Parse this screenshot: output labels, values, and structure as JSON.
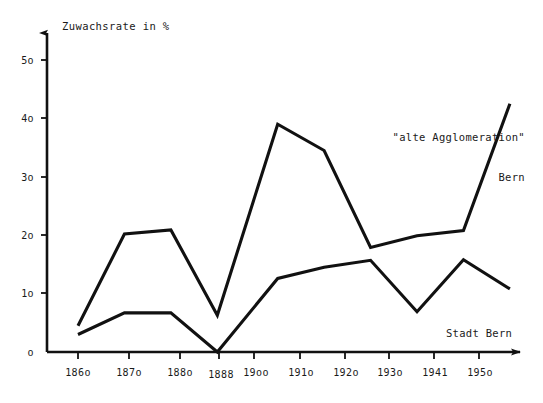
{
  "chart_data": {
    "type": "line",
    "title": "",
    "ylabel": "Zuwachsrate in %",
    "xlabel": "",
    "grid": false,
    "legend_position": "inline-annotations",
    "ylim": [
      0,
      52
    ],
    "y_ticks": [
      {
        "value": 0,
        "label": "o"
      },
      {
        "value": 10,
        "label": "1o"
      },
      {
        "value": 20,
        "label": "2o"
      },
      {
        "value": 30,
        "label": "3o"
      },
      {
        "value": 40,
        "label": "4o"
      },
      {
        "value": 50,
        "label": "5o"
      }
    ],
    "categories": [
      "186o",
      "187o",
      "188o",
      "1888",
      "19oo",
      "191o",
      "192o",
      "193o",
      "1941",
      "195o"
    ],
    "x_positions": [
      0,
      1,
      2,
      3,
      4.3,
      5.3,
      6.3,
      7.3,
      8.3,
      9.3
    ],
    "series": [
      {
        "name": "\"alte Agglomeration\" Bern",
        "values": [
          4.5,
          20.2,
          20.9,
          6.3,
          39.0,
          34.5,
          17.9,
          19.9,
          20.8,
          42.5
        ]
      },
      {
        "name": "Stadt Bern",
        "values": [
          3.0,
          6.7,
          6.7,
          0.0,
          12.6,
          14.5,
          15.7,
          6.9,
          15.8,
          10.8
        ]
      }
    ],
    "annotations": [
      {
        "id": "agglo",
        "line1": "\"alte Agglomeration\"",
        "line2": "Bern"
      },
      {
        "id": "stadt",
        "line1": "Stadt Bern"
      }
    ],
    "colors": {
      "line": "#111111",
      "axis": "#111111",
      "text": "#1a1a1a",
      "background": "#ffffff"
    }
  }
}
